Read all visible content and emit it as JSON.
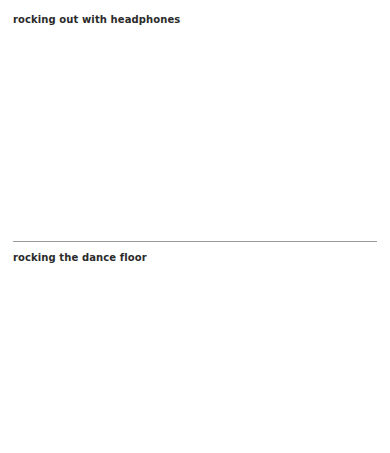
{
  "page": {
    "background_color": "#ffffff",
    "text_color": "#2b2b2b",
    "rule_color": "#9a9a9a"
  },
  "sections": [
    {
      "id": "headphones",
      "heading": "rocking out with headphones",
      "has_divider_above": false,
      "body_text": ""
    },
    {
      "id": "dancefloor",
      "heading": "rocking the dance floor",
      "has_divider_above": true,
      "body_text": ""
    }
  ]
}
